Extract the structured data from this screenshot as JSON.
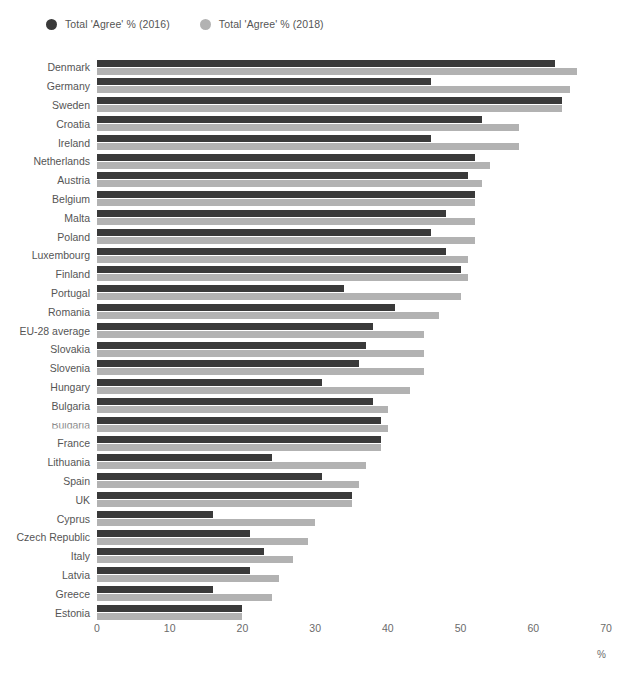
{
  "legend": {
    "position": "top-left",
    "entries": [
      {
        "label": "Total 'Agree' % (2016)",
        "color": "#3a3a3a",
        "marker": "circle"
      },
      {
        "label": "Total 'Agree' % (2018)",
        "color": "#b2b2b2",
        "marker": "circle"
      }
    ]
  },
  "axis": {
    "unit_label": "%",
    "ticks": [
      "0",
      "10",
      "20",
      "30",
      "40",
      "50",
      "60",
      "70"
    ]
  },
  "chart_data": {
    "type": "bar",
    "orientation": "horizontal",
    "title": "",
    "subtitle": "",
    "xlabel": "%",
    "ylabel": "",
    "xlim": [
      0,
      70
    ],
    "xticks": [
      0,
      10,
      20,
      30,
      40,
      50,
      60,
      70
    ],
    "grid": false,
    "legend_position": "top-left",
    "categories": [
      "Denmark",
      "Germany",
      "Sweden",
      "Croatia",
      "Ireland",
      "Netherlands",
      "Austria",
      "Belgium",
      "Malta",
      "Poland",
      "Luxembourg",
      "Finland",
      "Portugal",
      "Romania",
      "EU-28 average",
      "Slovakia",
      "Slovenia",
      "Hungary",
      "Bulgaria",
      "Bulgaria",
      "France",
      "Lithuania",
      "Spain",
      "UK",
      "Cyprus",
      "Czech Republic",
      "Italy",
      "Latvia",
      "Greece",
      "Estonia"
    ],
    "series": [
      {
        "name": "Total 'Agree' % (2016)",
        "color": "#3a3a3a",
        "values": [
          63,
          46,
          64,
          53,
          46,
          52,
          51,
          52,
          48,
          46,
          48,
          50,
          34,
          41,
          38,
          37,
          36,
          31,
          38,
          39,
          39,
          24,
          31,
          35,
          16,
          21,
          23,
          21,
          16,
          20
        ]
      },
      {
        "name": "Total 'Agree' % (2018)",
        "color": "#b2b2b2",
        "values": [
          66,
          65,
          64,
          58,
          58,
          54,
          53,
          52,
          52,
          52,
          51,
          51,
          50,
          47,
          45,
          45,
          45,
          43,
          40,
          40,
          39,
          37,
          36,
          35,
          30,
          29,
          27,
          25,
          24,
          20
        ]
      }
    ]
  }
}
